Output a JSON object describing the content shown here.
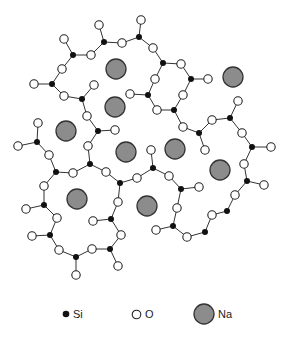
{
  "figure": {
    "colors": {
      "si": "#111111",
      "o_fill": "#ffffff",
      "o_stroke": "#222222",
      "na_fill": "#8c8c8c",
      "na_stroke": "#333333",
      "bond": "#333333"
    },
    "si": [
      [
        104,
        42
      ],
      [
        139,
        37
      ],
      [
        73,
        55
      ],
      [
        52,
        84
      ],
      [
        82,
        99
      ],
      [
        163,
        63
      ],
      [
        191,
        79
      ],
      [
        148,
        95
      ],
      [
        174,
        110
      ],
      [
        98,
        131
      ],
      [
        37,
        142
      ],
      [
        199,
        133
      ],
      [
        230,
        118
      ],
      [
        252,
        147
      ],
      [
        56,
        172
      ],
      [
        90,
        164
      ],
      [
        120,
        183
      ],
      [
        153,
        168
      ],
      [
        181,
        189
      ],
      [
        247,
        181
      ],
      [
        227,
        211
      ],
      [
        44,
        205
      ],
      [
        111,
        219
      ],
      [
        173,
        226
      ],
      [
        205,
        232
      ],
      [
        50,
        235
      ],
      [
        76,
        257
      ],
      [
        110,
        249
      ]
    ],
    "o": [
      [
        99,
        25
      ],
      [
        141,
        20
      ],
      [
        122,
        43
      ],
      [
        91,
        55
      ],
      [
        64,
        39
      ],
      [
        62,
        69
      ],
      [
        34,
        84
      ],
      [
        64,
        96
      ],
      [
        94,
        85
      ],
      [
        153,
        48
      ],
      [
        181,
        64
      ],
      [
        208,
        79
      ],
      [
        155,
        79
      ],
      [
        183,
        95
      ],
      [
        130,
        94
      ],
      [
        157,
        110
      ],
      [
        87,
        116
      ],
      [
        115,
        130
      ],
      [
        183,
        127
      ],
      [
        212,
        120
      ],
      [
        238,
        101
      ],
      [
        242,
        133
      ],
      [
        271,
        147
      ],
      [
        38,
        123
      ],
      [
        18,
        146
      ],
      [
        49,
        155
      ],
      [
        73,
        173
      ],
      [
        106,
        172
      ],
      [
        88,
        146
      ],
      [
        137,
        178
      ],
      [
        151,
        150
      ],
      [
        169,
        176
      ],
      [
        205,
        150
      ],
      [
        244,
        164
      ],
      [
        199,
        187
      ],
      [
        264,
        185
      ],
      [
        235,
        195
      ],
      [
        44,
        186
      ],
      [
        118,
        202
      ],
      [
        26,
        209
      ],
      [
        57,
        218
      ],
      [
        93,
        221
      ],
      [
        177,
        208
      ],
      [
        212,
        215
      ],
      [
        156,
        230
      ],
      [
        121,
        235
      ],
      [
        187,
        237
      ],
      [
        32,
        236
      ],
      [
        59,
        250
      ],
      [
        92,
        249
      ],
      [
        118,
        266
      ],
      [
        76,
        275
      ]
    ],
    "na": [
      [
        116,
        69
      ],
      [
        115,
        107
      ],
      [
        233,
        77
      ],
      [
        66,
        131
      ],
      [
        126,
        152
      ],
      [
        175,
        149
      ],
      [
        220,
        170
      ],
      [
        77,
        199
      ],
      [
        147,
        206
      ]
    ],
    "bonds": [
      [
        [
          99,
          25
        ],
        [
          104,
          42
        ]
      ],
      [
        [
          104,
          42
        ],
        [
          122,
          43
        ]
      ],
      [
        [
          122,
          43
        ],
        [
          139,
          37
        ]
      ],
      [
        [
          139,
          37
        ],
        [
          141,
          20
        ]
      ],
      [
        [
          104,
          42
        ],
        [
          91,
          55
        ]
      ],
      [
        [
          91,
          55
        ],
        [
          73,
          55
        ]
      ],
      [
        [
          73,
          55
        ],
        [
          64,
          39
        ]
      ],
      [
        [
          73,
          55
        ],
        [
          62,
          69
        ]
      ],
      [
        [
          62,
          69
        ],
        [
          52,
          84
        ]
      ],
      [
        [
          52,
          84
        ],
        [
          34,
          84
        ]
      ],
      [
        [
          52,
          84
        ],
        [
          64,
          96
        ]
      ],
      [
        [
          64,
          96
        ],
        [
          82,
          99
        ]
      ],
      [
        [
          82,
          99
        ],
        [
          94,
          85
        ]
      ],
      [
        [
          82,
          99
        ],
        [
          87,
          116
        ]
      ],
      [
        [
          87,
          116
        ],
        [
          98,
          131
        ]
      ],
      [
        [
          98,
          131
        ],
        [
          115,
          130
        ]
      ],
      [
        [
          98,
          131
        ],
        [
          88,
          146
        ]
      ],
      [
        [
          139,
          37
        ],
        [
          153,
          48
        ]
      ],
      [
        [
          153,
          48
        ],
        [
          163,
          63
        ]
      ],
      [
        [
          163,
          63
        ],
        [
          181,
          64
        ]
      ],
      [
        [
          181,
          64
        ],
        [
          191,
          79
        ]
      ],
      [
        [
          191,
          79
        ],
        [
          208,
          79
        ]
      ],
      [
        [
          163,
          63
        ],
        [
          155,
          79
        ]
      ],
      [
        [
          155,
          79
        ],
        [
          148,
          95
        ]
      ],
      [
        [
          148,
          95
        ],
        [
          130,
          94
        ]
      ],
      [
        [
          148,
          95
        ],
        [
          157,
          110
        ]
      ],
      [
        [
          157,
          110
        ],
        [
          174,
          110
        ]
      ],
      [
        [
          191,
          79
        ],
        [
          183,
          95
        ]
      ],
      [
        [
          183,
          95
        ],
        [
          174,
          110
        ]
      ],
      [
        [
          174,
          110
        ],
        [
          183,
          127
        ]
      ],
      [
        [
          183,
          127
        ],
        [
          199,
          133
        ]
      ],
      [
        [
          199,
          133
        ],
        [
          212,
          120
        ]
      ],
      [
        [
          212,
          120
        ],
        [
          230,
          118
        ]
      ],
      [
        [
          230,
          118
        ],
        [
          238,
          101
        ]
      ],
      [
        [
          230,
          118
        ],
        [
          242,
          133
        ]
      ],
      [
        [
          242,
          133
        ],
        [
          252,
          147
        ]
      ],
      [
        [
          252,
          147
        ],
        [
          271,
          147
        ]
      ],
      [
        [
          252,
          147
        ],
        [
          244,
          164
        ]
      ],
      [
        [
          244,
          164
        ],
        [
          247,
          181
        ]
      ],
      [
        [
          247,
          181
        ],
        [
          264,
          185
        ]
      ],
      [
        [
          247,
          181
        ],
        [
          235,
          195
        ]
      ],
      [
        [
          235,
          195
        ],
        [
          227,
          211
        ]
      ],
      [
        [
          227,
          211
        ],
        [
          212,
          215
        ]
      ],
      [
        [
          212,
          215
        ],
        [
          205,
          232
        ]
      ],
      [
        [
          205,
          232
        ],
        [
          187,
          237
        ]
      ],
      [
        [
          187,
          237
        ],
        [
          173,
          226
        ]
      ],
      [
        [
          173,
          226
        ],
        [
          156,
          230
        ]
      ],
      [
        [
          173,
          226
        ],
        [
          177,
          208
        ]
      ],
      [
        [
          177,
          208
        ],
        [
          181,
          189
        ]
      ],
      [
        [
          181,
          189
        ],
        [
          199,
          187
        ]
      ],
      [
        [
          181,
          189
        ],
        [
          169,
          176
        ]
      ],
      [
        [
          169,
          176
        ],
        [
          153,
          168
        ]
      ],
      [
        [
          153,
          168
        ],
        [
          151,
          150
        ]
      ],
      [
        [
          153,
          168
        ],
        [
          137,
          178
        ]
      ],
      [
        [
          137,
          178
        ],
        [
          120,
          183
        ]
      ],
      [
        [
          199,
          133
        ],
        [
          205,
          150
        ]
      ],
      [
        [
          38,
          123
        ],
        [
          37,
          142
        ]
      ],
      [
        [
          37,
          142
        ],
        [
          18,
          146
        ]
      ],
      [
        [
          37,
          142
        ],
        [
          49,
          155
        ]
      ],
      [
        [
          49,
          155
        ],
        [
          56,
          172
        ]
      ],
      [
        [
          56,
          172
        ],
        [
          73,
          173
        ]
      ],
      [
        [
          73,
          173
        ],
        [
          90,
          164
        ]
      ],
      [
        [
          90,
          164
        ],
        [
          88,
          146
        ]
      ],
      [
        [
          90,
          164
        ],
        [
          106,
          172
        ]
      ],
      [
        [
          106,
          172
        ],
        [
          120,
          183
        ]
      ],
      [
        [
          56,
          172
        ],
        [
          44,
          186
        ]
      ],
      [
        [
          44,
          186
        ],
        [
          44,
          205
        ]
      ],
      [
        [
          44,
          205
        ],
        [
          26,
          209
        ]
      ],
      [
        [
          44,
          205
        ],
        [
          57,
          218
        ]
      ],
      [
        [
          57,
          218
        ],
        [
          50,
          235
        ]
      ],
      [
        [
          50,
          235
        ],
        [
          32,
          236
        ]
      ],
      [
        [
          50,
          235
        ],
        [
          59,
          250
        ]
      ],
      [
        [
          59,
          250
        ],
        [
          76,
          257
        ]
      ],
      [
        [
          76,
          257
        ],
        [
          76,
          275
        ]
      ],
      [
        [
          76,
          257
        ],
        [
          92,
          249
        ]
      ],
      [
        [
          92,
          249
        ],
        [
          110,
          249
        ]
      ],
      [
        [
          110,
          249
        ],
        [
          118,
          266
        ]
      ],
      [
        [
          110,
          249
        ],
        [
          121,
          235
        ]
      ],
      [
        [
          121,
          235
        ],
        [
          111,
          219
        ]
      ],
      [
        [
          111,
          219
        ],
        [
          93,
          221
        ]
      ],
      [
        [
          111,
          219
        ],
        [
          118,
          202
        ]
      ],
      [
        [
          118,
          202
        ],
        [
          120,
          183
        ]
      ]
    ]
  },
  "legend": {
    "items": [
      {
        "key": "si",
        "label": "Si"
      },
      {
        "key": "o",
        "label": "O"
      },
      {
        "key": "na",
        "label": "Na"
      }
    ]
  }
}
